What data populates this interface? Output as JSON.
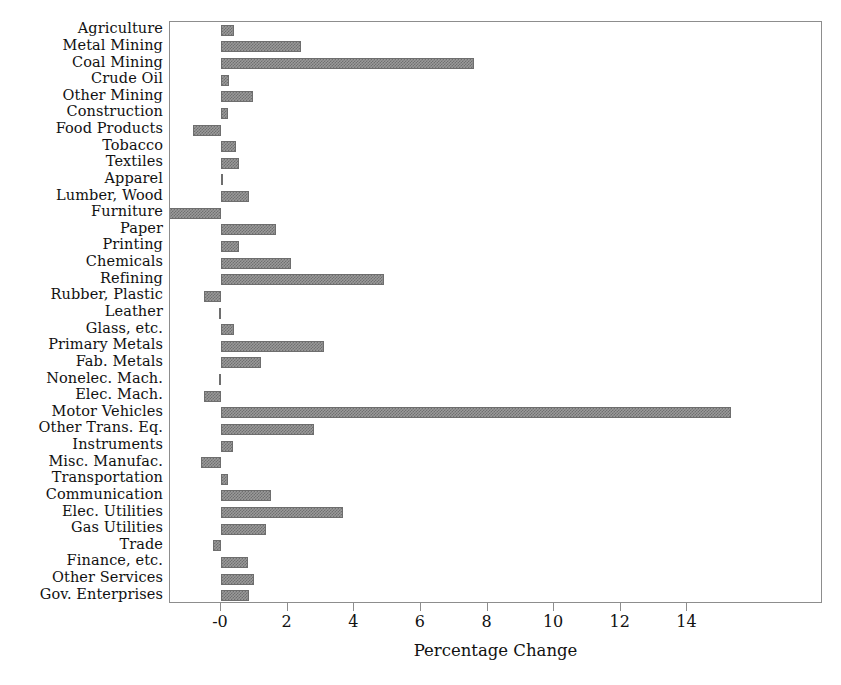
{
  "chart_data": {
    "type": "bar",
    "orientation": "horizontal",
    "title": "",
    "xlabel": "Percentage Change",
    "ylabel": "",
    "xlim": [
      -1.53,
      18.07
    ],
    "xticks": [
      0,
      2,
      4,
      6,
      8,
      10,
      12,
      14
    ],
    "xticklabels": [
      "-0",
      "2",
      "4",
      "6",
      "8",
      "10",
      "12",
      "14"
    ],
    "grid": false,
    "legend": null,
    "bar_color": "#9a9a9a",
    "bar_edge_color": "#6e6e6e",
    "frame_color": "#8d8d8d",
    "categories": [
      "Agriculture",
      "Metal Mining",
      "Coal Mining",
      "Crude Oil",
      "Other Mining",
      "Construction",
      "Food Products",
      "Tobacco",
      "Textiles",
      "Apparel",
      "Lumber, Wood",
      "Furniture",
      "Paper",
      "Printing",
      "Chemicals",
      "Refining",
      "Rubber, Plastic",
      "Leather",
      "Glass, etc.",
      "Primary Metals",
      "Fab. Metals",
      "Nonelec. Mach.",
      "Elec. Mach.",
      "Motor Vehicles",
      "Other Trans. Eq.",
      "Instruments",
      "Misc. Manufac.",
      "Transportation",
      "Communication",
      "Elec. Utilities",
      "Gas Utilities",
      "Trade",
      "Finance, etc.",
      "Other Services",
      "Gov. Enterprises"
    ],
    "values": [
      0.4,
      2.4,
      7.6,
      0.25,
      0.95,
      0.2,
      -0.85,
      0.45,
      0.55,
      0.03,
      0.85,
      -1.85,
      1.65,
      0.55,
      2.1,
      4.9,
      -0.5,
      -0.06,
      0.4,
      3.1,
      1.2,
      -0.05,
      -0.5,
      15.3,
      2.8,
      0.35,
      -0.6,
      0.2,
      1.5,
      3.65,
      1.35,
      -0.25,
      0.8,
      1.0,
      0.85
    ]
  }
}
